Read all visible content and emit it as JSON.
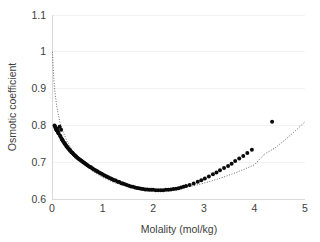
{
  "chart_data": {
    "type": "scatter",
    "title": "",
    "xlabel": "Molality (mol/kg)",
    "ylabel": "Osmotic coefficient",
    "xlim": [
      0,
      5
    ],
    "ylim": [
      0.6,
      1.1
    ],
    "xticks": [
      0,
      1,
      2,
      3,
      4,
      5
    ],
    "xticklabels": [
      "0",
      "1",
      "2",
      "3",
      "4",
      "5"
    ],
    "yticks": [
      0.6,
      0.7,
      0.8,
      0.9,
      1.0,
      1.1
    ],
    "yticklabels": [
      "0.6",
      "0.7",
      "0.8",
      "0.9",
      "1",
      "1.1"
    ],
    "grid": true,
    "grid_axis": "y",
    "legend": "none",
    "marker_color": "#0a0a0a",
    "marker_size": 2.0,
    "fit_line_color": "#555555",
    "fit_line_style": "dotted",
    "series": [
      {
        "name": "measured osmotic coefficient",
        "type": "scatter",
        "x": [
          0.05,
          0.06,
          0.07,
          0.08,
          0.09,
          0.1,
          0.11,
          0.12,
          0.13,
          0.15,
          0.16,
          0.17,
          0.18,
          0.19,
          0.2,
          0.21,
          0.22,
          0.24,
          0.25,
          0.26,
          0.28,
          0.29,
          0.3,
          0.32,
          0.33,
          0.35,
          0.36,
          0.38,
          0.4,
          0.41,
          0.43,
          0.45,
          0.47,
          0.48,
          0.5,
          0.52,
          0.54,
          0.56,
          0.58,
          0.6,
          0.62,
          0.64,
          0.66,
          0.68,
          0.7,
          0.72,
          0.75,
          0.77,
          0.8,
          0.82,
          0.85,
          0.88,
          0.9,
          0.93,
          0.96,
          0.99,
          1.02,
          1.05,
          1.08,
          1.11,
          1.14,
          1.17,
          1.2,
          1.23,
          1.26,
          1.3,
          1.33,
          1.37,
          1.4,
          1.44,
          1.48,
          1.52,
          1.56,
          1.6,
          1.64,
          1.68,
          1.72,
          1.76,
          1.8,
          1.84,
          1.88,
          1.92,
          1.96,
          2.0,
          2.05,
          2.1,
          2.15,
          2.2,
          2.25,
          2.3,
          2.35,
          2.4,
          2.45,
          2.5,
          2.55,
          2.6,
          2.65,
          2.72,
          2.8,
          2.88,
          2.95,
          3.02,
          3.1,
          3.18,
          3.25,
          3.32,
          3.4,
          3.48,
          3.55,
          3.62,
          3.7,
          3.78,
          3.86,
          3.95,
          4.35
        ],
        "y": [
          0.8,
          0.797,
          0.793,
          0.79,
          0.787,
          0.79,
          0.784,
          0.781,
          0.778,
          0.796,
          0.772,
          0.769,
          0.788,
          0.764,
          0.762,
          0.759,
          0.757,
          0.753,
          0.751,
          0.749,
          0.745,
          0.743,
          0.741,
          0.738,
          0.736,
          0.733,
          0.731,
          0.728,
          0.726,
          0.724,
          0.721,
          0.719,
          0.716,
          0.715,
          0.712,
          0.71,
          0.708,
          0.706,
          0.704,
          0.702,
          0.7,
          0.698,
          0.696,
          0.694,
          0.692,
          0.69,
          0.687,
          0.686,
          0.683,
          0.681,
          0.679,
          0.676,
          0.675,
          0.672,
          0.67,
          0.668,
          0.665,
          0.663,
          0.661,
          0.659,
          0.657,
          0.655,
          0.653,
          0.651,
          0.65,
          0.647,
          0.646,
          0.643,
          0.642,
          0.64,
          0.638,
          0.636,
          0.634,
          0.633,
          0.631,
          0.63,
          0.629,
          0.628,
          0.627,
          0.626,
          0.626,
          0.625,
          0.625,
          0.625,
          0.624,
          0.624,
          0.624,
          0.624,
          0.625,
          0.625,
          0.626,
          0.627,
          0.628,
          0.629,
          0.631,
          0.633,
          0.635,
          0.638,
          0.642,
          0.647,
          0.651,
          0.656,
          0.661,
          0.667,
          0.672,
          0.678,
          0.684,
          0.69,
          0.696,
          0.703,
          0.71,
          0.717,
          0.725,
          0.734,
          0.81
        ],
        "note": "dense cluster at low molality; minimum near m = 1.8-2.1, phi = 0.624; one high outlier at m = 4.35"
      },
      {
        "name": "model fit",
        "type": "line",
        "style": "dotted",
        "x": [
          0.01,
          0.02,
          0.03,
          0.04,
          0.05,
          0.07,
          0.1,
          0.15,
          0.2,
          0.3,
          0.4,
          0.5,
          0.6,
          0.7,
          0.8,
          0.9,
          1.0,
          1.2,
          1.4,
          1.6,
          1.8,
          2.0,
          2.2,
          2.4,
          2.6,
          2.8,
          3.0,
          3.2,
          3.4,
          3.6,
          3.8,
          4.0,
          4.2,
          4.4,
          4.6,
          4.8,
          5.0
        ],
        "y": [
          1.0,
          0.965,
          0.94,
          0.92,
          0.903,
          0.876,
          0.847,
          0.812,
          0.789,
          0.756,
          0.733,
          0.715,
          0.7,
          0.687,
          0.676,
          0.667,
          0.659,
          0.646,
          0.637,
          0.631,
          0.627,
          0.625,
          0.625,
          0.627,
          0.631,
          0.636,
          0.643,
          0.651,
          0.66,
          0.67,
          0.681,
          0.693,
          0.722,
          0.738,
          0.76,
          0.784,
          0.81
        ]
      }
    ]
  },
  "geometry": {
    "plot_left": 52,
    "plot_right": 305,
    "plot_top": 15,
    "plot_bottom": 199
  }
}
